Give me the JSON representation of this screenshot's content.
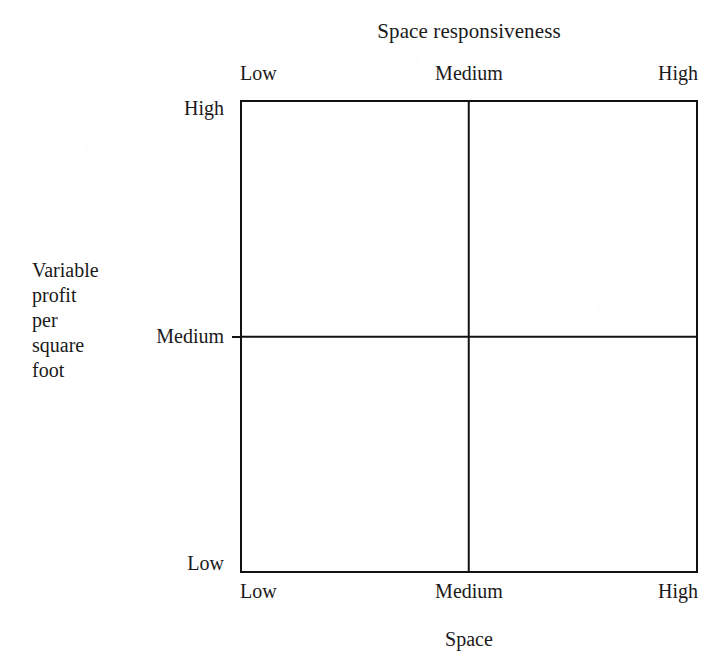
{
  "chart_data": {
    "type": "table",
    "title": "Space responsiveness",
    "subtitle": "",
    "xlabel": "Space",
    "ylabel": "Variable profit per square foot",
    "ylabel_lines": [
      "Variable",
      "profit",
      "per",
      "square",
      "foot"
    ],
    "x_tick_labels": [
      "Low",
      "Medium",
      "High"
    ],
    "y_tick_labels": [
      "High",
      "Medium",
      "Low"
    ],
    "top_axis_label": "Space responsiveness",
    "top_tick_labels": [
      "Low",
      "Medium",
      "High"
    ],
    "grid": true,
    "rows": 2,
    "columns": 2,
    "cells": [
      {
        "row": 0,
        "col": 0,
        "label": ""
      },
      {
        "row": 0,
        "col": 1,
        "label": ""
      },
      {
        "row": 1,
        "col": 0,
        "label": ""
      },
      {
        "row": 1,
        "col": 1,
        "label": ""
      }
    ],
    "legend": [],
    "annotations": [],
    "colors": {
      "line": "#121212",
      "background": "#ffffff",
      "text": "#1a1a1a"
    }
  },
  "figure": {
    "top_title": "Space responsiveness",
    "bottom_title": "Space",
    "top_ticks": {
      "low": "Low",
      "medium": "Medium",
      "high": "High"
    },
    "bottom_ticks": {
      "low": "Low",
      "medium": "Medium",
      "high": "High"
    },
    "left_ticks": {
      "high": "High",
      "medium": "Medium",
      "low": "Low"
    },
    "y_axis_title_lines": {
      "l1": "Variable",
      "l2": "profit",
      "l3": "per",
      "l4": "square",
      "l5": "foot"
    }
  }
}
